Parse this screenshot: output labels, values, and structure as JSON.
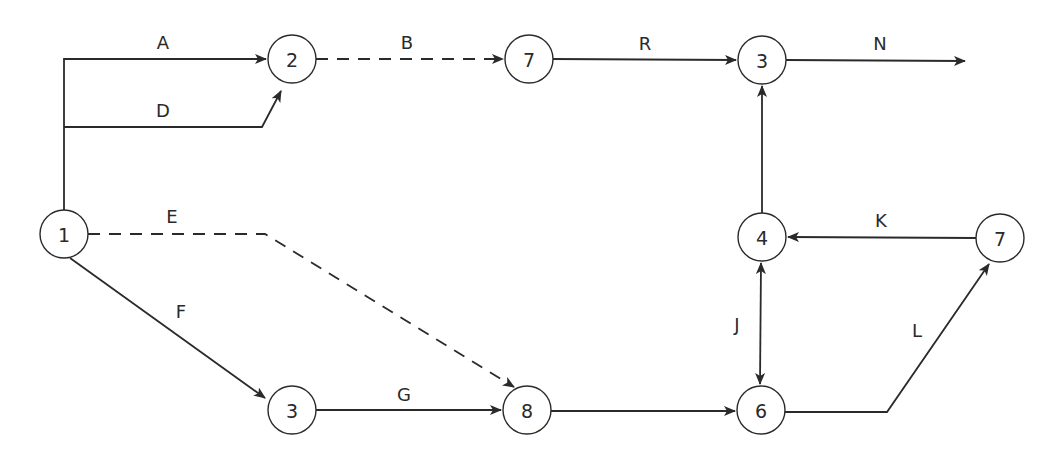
{
  "diagram": {
    "type": "activity-network",
    "nodes": [
      {
        "id": "n1",
        "label": "1",
        "x": 64,
        "y": 234
      },
      {
        "id": "n2",
        "label": "2",
        "x": 292,
        "y": 59
      },
      {
        "id": "n7a",
        "label": "7",
        "x": 529,
        "y": 59
      },
      {
        "id": "n3a",
        "label": "3",
        "x": 762,
        "y": 60
      },
      {
        "id": "n3b",
        "label": "3",
        "x": 292,
        "y": 410
      },
      {
        "id": "n8",
        "label": "8",
        "x": 527,
        "y": 410
      },
      {
        "id": "n6",
        "label": "6",
        "x": 761,
        "y": 410
      },
      {
        "id": "n4",
        "label": "4",
        "x": 762,
        "y": 237
      },
      {
        "id": "n7b",
        "label": "7",
        "x": 1000,
        "y": 238
      }
    ],
    "edges": [
      {
        "id": "A",
        "label": "A",
        "from": "n1",
        "to": "n2",
        "style": "solid"
      },
      {
        "id": "D",
        "label": "D",
        "from": "n1",
        "to": "n2",
        "style": "solid"
      },
      {
        "id": "B",
        "label": "B",
        "from": "n2",
        "to": "n7a",
        "style": "dashed"
      },
      {
        "id": "R",
        "label": "R",
        "from": "n7a",
        "to": "n3a",
        "style": "solid"
      },
      {
        "id": "N",
        "label": "N",
        "from": "n3a",
        "to": "end",
        "style": "solid"
      },
      {
        "id": "E",
        "label": "E",
        "from": "n1",
        "to": "n8",
        "style": "dashed"
      },
      {
        "id": "F",
        "label": "F",
        "from": "n1",
        "to": "n3b",
        "style": "solid"
      },
      {
        "id": "G",
        "label": "G",
        "from": "n3b",
        "to": "n8",
        "style": "solid"
      },
      {
        "id": "H",
        "label": "",
        "from": "n8",
        "to": "n6",
        "style": "solid"
      },
      {
        "id": "J",
        "label": "J",
        "from": "n4",
        "to": "n6",
        "style": "solid",
        "bidirectional": true
      },
      {
        "id": "L",
        "label": "L",
        "from": "n6",
        "to": "n7b",
        "style": "solid"
      },
      {
        "id": "K",
        "label": "K",
        "from": "n7b",
        "to": "n4",
        "style": "solid"
      },
      {
        "id": "I",
        "label": "",
        "from": "n4",
        "to": "n3a",
        "style": "solid"
      }
    ]
  },
  "labels": {
    "A": "A",
    "B": "B",
    "D": "D",
    "E": "E",
    "F": "F",
    "G": "G",
    "J": "J",
    "K": "K",
    "L": "L",
    "N": "N",
    "R": "R"
  },
  "node_labels": {
    "n1": "1",
    "n2": "2",
    "n7a": "7",
    "n3a": "3",
    "n3b": "3",
    "n8": "8",
    "n6": "6",
    "n4": "4",
    "n7b": "7"
  },
  "colors": {
    "stroke": "#2a2a2a",
    "background": "#ffffff"
  }
}
